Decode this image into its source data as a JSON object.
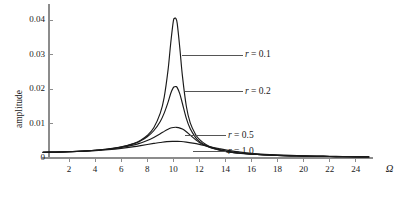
{
  "chart_data": {
    "type": "line",
    "title": "",
    "xlabel": "Ω",
    "ylabel": "amplitude",
    "xlim": [
      0,
      25.2
    ],
    "ylim": [
      0,
      0.0435
    ],
    "grid": false,
    "legend_position": "inline-annotations",
    "xticks": [
      2,
      4,
      6,
      8,
      10,
      12,
      14,
      16,
      18,
      20,
      22,
      24
    ],
    "xtick_labels": [
      "2",
      "4",
      "6",
      "8",
      "10",
      "12",
      "14",
      "16",
      "18",
      "20",
      "22",
      "24"
    ],
    "yticks": [
      0,
      0.01,
      0.02,
      0.03,
      0.04
    ],
    "ytick_labels": [
      "0",
      "0.01",
      "0.02",
      "0.03",
      "0.04"
    ],
    "origin_label": "0",
    "series": [
      {
        "name": "r = 0.1",
        "label_prefix": "r",
        "label_value": "= 0.1",
        "r": 0.1,
        "peak_x": 10.2,
        "peak_y": 0.0405,
        "color": "#1a1a1a",
        "annotation": {
          "x": 15.5,
          "y": 0.0298,
          "leader_from_x": 10.7,
          "leader_from_y": 0.0298
        },
        "x": [
          0,
          1,
          2,
          3,
          4,
          5,
          6,
          7,
          7.5,
          8,
          8.5,
          9,
          9.3,
          9.6,
          9.8,
          10,
          10.1,
          10.2,
          10.3,
          10.5,
          10.7,
          11,
          11.3,
          11.7,
          12,
          12.5,
          13,
          14,
          15,
          16,
          17,
          18,
          19,
          20,
          21,
          22,
          23,
          24,
          25
        ],
        "y": [
          0.00168,
          0.00172,
          0.00182,
          0.00198,
          0.00224,
          0.00262,
          0.00322,
          0.00428,
          0.00516,
          0.00652,
          0.00878,
          0.013,
          0.0176,
          0.0256,
          0.0332,
          0.0396,
          0.0405,
          0.0404,
          0.039,
          0.0319,
          0.0238,
          0.015,
          0.0102,
          0.0069,
          0.0054,
          0.00392,
          0.00302,
          0.00198,
          0.00144,
          0.00112,
          0.0009,
          0.00074,
          0.00063,
          0.00055,
          0.00048,
          0.00043,
          0.00038,
          0.00034,
          0.00031
        ]
      },
      {
        "name": "r = 0.2",
        "label_prefix": "r",
        "label_value": "= 0.2",
        "r": 0.2,
        "peak_x": 10.2,
        "peak_y": 0.0207,
        "color": "#1a1a1a",
        "annotation": {
          "x": 15.5,
          "y": 0.0192,
          "leader_from_x": 10.9,
          "leader_from_y": 0.0192
        },
        "x": [
          0,
          1,
          2,
          3,
          4,
          5,
          6,
          7,
          7.5,
          8,
          8.5,
          9,
          9.3,
          9.6,
          9.8,
          10,
          10.1,
          10.2,
          10.3,
          10.5,
          10.7,
          11,
          11.3,
          11.7,
          12,
          12.5,
          13,
          14,
          15,
          16,
          17,
          18,
          19,
          20,
          21,
          22,
          23,
          24,
          25
        ],
        "y": [
          0.00168,
          0.00172,
          0.00182,
          0.00198,
          0.00224,
          0.0026,
          0.00318,
          0.00418,
          0.00498,
          0.00614,
          0.0079,
          0.0106,
          0.013,
          0.0162,
          0.0187,
          0.0204,
          0.02065,
          0.0207,
          0.0204,
          0.0186,
          0.0158,
          0.0115,
          0.00845,
          0.006,
          0.00482,
          0.00362,
          0.00285,
          0.00192,
          0.00141,
          0.0011,
          0.00089,
          0.00074,
          0.00062,
          0.00054,
          0.00048,
          0.00042,
          0.00038,
          0.00034,
          0.00031
        ]
      },
      {
        "name": "r = 0.5",
        "label_prefix": "r",
        "label_value": "= 0.5",
        "r": 0.5,
        "peak_x": 10.3,
        "peak_y": 0.0089,
        "color": "#1a1a1a",
        "annotation": {
          "x": 14.2,
          "y": 0.0065,
          "leader_from_x": 10.9,
          "leader_from_y": 0.0065
        },
        "x": [
          0,
          1,
          2,
          3,
          4,
          5,
          6,
          7,
          7.5,
          8,
          8.5,
          9,
          9.3,
          9.6,
          9.8,
          10,
          10.2,
          10.4,
          10.7,
          11,
          11.3,
          11.7,
          12,
          12.5,
          13,
          14,
          15,
          16,
          17,
          18,
          19,
          20,
          21,
          22,
          23,
          24,
          25
        ],
        "y": [
          0.00168,
          0.00172,
          0.00182,
          0.00196,
          0.0022,
          0.00254,
          0.00304,
          0.00382,
          0.00436,
          0.00506,
          0.00596,
          0.00702,
          0.00772,
          0.00836,
          0.00868,
          0.00884,
          0.0089,
          0.00882,
          0.0084,
          0.00762,
          0.00662,
          0.00534,
          0.00452,
          0.00352,
          0.00283,
          0.00194,
          0.00144,
          0.00112,
          0.0009,
          0.00075,
          0.00063,
          0.00055,
          0.00048,
          0.00043,
          0.00038,
          0.00035,
          0.00032
        ]
      },
      {
        "name": "r = 1.0",
        "label_prefix": "r",
        "label_value": "= 1.0",
        "r": 1.0,
        "peak_x": 10.6,
        "peak_y": 0.0048,
        "color": "#1a1a1a",
        "annotation": {
          "x": 14.2,
          "y": 0.00185,
          "leader_from_x": 11.5,
          "leader_from_y": 0.00185
        },
        "x": [
          0,
          1,
          2,
          3,
          4,
          5,
          6,
          7,
          7.5,
          8,
          8.5,
          9,
          9.5,
          10,
          10.3,
          10.6,
          11,
          11.5,
          12,
          12.5,
          13,
          13.5,
          14,
          15,
          16,
          17,
          18,
          19,
          20,
          21,
          22,
          23,
          24,
          25
        ],
        "y": [
          0.00168,
          0.00172,
          0.0018,
          0.00194,
          0.00214,
          0.00242,
          0.0028,
          0.0033,
          0.0036,
          0.00392,
          0.00422,
          0.0045,
          0.00474,
          0.00482,
          0.00482,
          0.00478,
          0.00462,
          0.00432,
          0.00396,
          0.00354,
          0.00312,
          0.00272,
          0.00236,
          0.00178,
          0.00138,
          0.0011,
          0.0009,
          0.00076,
          0.00065,
          0.00056,
          0.00049,
          0.00044,
          0.00039,
          0.00035
        ]
      }
    ],
    "axis_color": "#8c8c8c",
    "curve_color": "#1a1a1a"
  }
}
